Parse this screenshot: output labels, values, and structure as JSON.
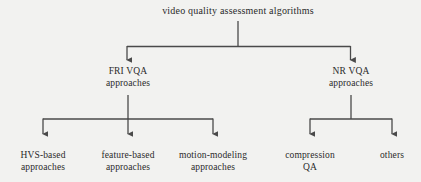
{
  "diagram": {
    "type": "tree",
    "title": "video quality assessment algorithms",
    "colors": {
      "background": "#f2f2f0",
      "line": "#4a4a4a",
      "text": "#2a2a2a"
    },
    "root": {
      "label": "video quality assessment algorithms"
    },
    "level1": [
      {
        "label": "FRI VQA\napproaches"
      },
      {
        "label": "NR VQA\napproaches"
      }
    ],
    "level2_left": [
      {
        "label": "HVS-based\napproaches"
      },
      {
        "label": "feature-based\napproaches"
      },
      {
        "label": "motion-modeling\napproaches"
      }
    ],
    "level2_right": [
      {
        "label": "compression\nQA"
      },
      {
        "label": "others"
      }
    ]
  }
}
